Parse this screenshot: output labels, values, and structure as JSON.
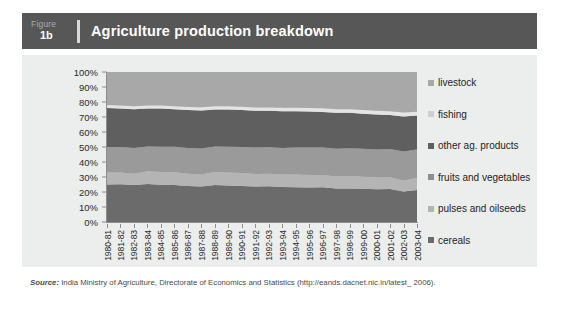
{
  "header": {
    "figure_word": "Figure",
    "figure_number": "1b",
    "title": "Agriculture production breakdown"
  },
  "source": {
    "label": "Source:",
    "text": " India Ministry of Agriculture, Directorate of Economics and Statistics (http://eands.dacnet.nic.in/latest_ 2006)."
  },
  "colors": {
    "header_bar": "#575757",
    "panel_background": "#eceded",
    "plot_background": "#d9d9d9",
    "axis": "#8e8e8e",
    "livestock": "#a8a8a8",
    "fishing": "#e4e4e4",
    "other_ag_products": "#5f5f5f",
    "fruits_and_vegetables": "#9a9a9a",
    "pulses_and_oilseeds": "#b4b4b4",
    "cereals": "#6b6b6b"
  },
  "chart_data": {
    "type": "area",
    "title": "Agriculture production breakdown",
    "xlabel": "",
    "ylabel": "",
    "ylim": [
      0,
      100
    ],
    "yticks": [
      "0%",
      "10%",
      "20%",
      "30%",
      "40%",
      "50%",
      "60%",
      "70%",
      "80%",
      "90%",
      "100%"
    ],
    "grid": false,
    "stacked": true,
    "normalized_percent": true,
    "legend_position": "right",
    "legend_order_top_to_bottom": [
      "livestock",
      "fishing",
      "other ag. products",
      "fruits and vegetables",
      "pulses and oilseeds",
      "cereals"
    ],
    "categories": [
      "1980-81",
      "1981-82",
      "1982-83",
      "1983-84",
      "1984-85",
      "1985-86",
      "1986-87",
      "1987-88",
      "1988-89",
      "1989-90",
      "1990-91",
      "1991-92",
      "1992-93",
      "1993-94",
      "1994-95",
      "1995-96",
      "1996-97",
      "1997-98",
      "1998-99",
      "1999-00",
      "2000-01",
      "2001-02",
      "2002-03",
      "2003-04"
    ],
    "series": [
      {
        "name": "cereals",
        "color": "#6b6b6b",
        "values": [
          25.0,
          25.2,
          24.6,
          25.4,
          24.8,
          24.6,
          24.0,
          23.6,
          24.6,
          24.4,
          24.0,
          23.6,
          23.8,
          23.4,
          23.2,
          23.0,
          23.2,
          22.4,
          22.4,
          22.2,
          21.8,
          22.0,
          20.4,
          21.4
        ]
      },
      {
        "name": "pulses and oilseeds",
        "color": "#b4b4b4",
        "values": [
          8.0,
          7.8,
          7.6,
          8.4,
          8.6,
          8.6,
          8.2,
          8.0,
          8.8,
          8.6,
          8.6,
          8.4,
          8.4,
          8.2,
          8.4,
          8.4,
          8.2,
          8.0,
          8.2,
          8.0,
          7.8,
          7.8,
          7.2,
          8.0
        ]
      },
      {
        "name": "fruits and vegetables",
        "color": "#9a9a9a",
        "values": [
          17.0,
          17.0,
          17.2,
          16.6,
          16.8,
          17.0,
          17.2,
          17.4,
          17.0,
          17.2,
          17.4,
          17.6,
          17.6,
          17.8,
          18.0,
          18.2,
          18.2,
          18.4,
          18.6,
          18.6,
          18.8,
          18.8,
          19.4,
          19.0
        ]
      },
      {
        "name": "other ag. products",
        "color": "#5f5f5f",
        "values": [
          26.0,
          25.6,
          25.8,
          25.2,
          25.4,
          25.0,
          25.2,
          25.4,
          24.6,
          24.8,
          24.6,
          24.6,
          24.4,
          24.4,
          24.2,
          24.0,
          23.8,
          24.0,
          23.6,
          23.4,
          23.2,
          22.8,
          23.4,
          22.6
        ]
      },
      {
        "name": "fishing",
        "color": "#e4e4e4",
        "values": [
          2.0,
          2.0,
          2.0,
          2.0,
          2.0,
          2.0,
          2.0,
          2.1,
          2.1,
          2.1,
          2.2,
          2.2,
          2.2,
          2.3,
          2.3,
          2.4,
          2.4,
          2.4,
          2.4,
          2.5,
          2.5,
          2.5,
          2.6,
          2.5
        ]
      },
      {
        "name": "livestock",
        "color": "#a8a8a8",
        "values": [
          22.0,
          22.4,
          22.8,
          22.4,
          22.4,
          22.8,
          23.4,
          23.5,
          22.9,
          22.9,
          23.2,
          23.6,
          23.6,
          23.9,
          23.9,
          24.0,
          24.2,
          24.8,
          24.8,
          25.3,
          25.9,
          26.1,
          27.0,
          26.5
        ]
      }
    ]
  },
  "legend": {
    "items": [
      {
        "label": "livestock",
        "color": "#a8a8a8"
      },
      {
        "label": "fishing",
        "color": "#cfcfcf"
      },
      {
        "label": "other ag. products",
        "color": "#5f5f5f"
      },
      {
        "label": "fruits and vegetables",
        "color": "#8e8e8e"
      },
      {
        "label": "pulses and oilseeds",
        "color": "#b4b4b4"
      },
      {
        "label": "cereals",
        "color": "#6b6b6b"
      }
    ]
  }
}
